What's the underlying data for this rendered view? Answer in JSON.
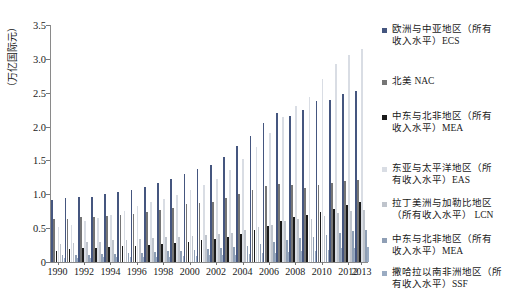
{
  "chart_data": {
    "type": "bar",
    "title": "",
    "xlabel": "",
    "ylabel": "（万亿国际元）",
    "ylim": [
      0,
      3.5
    ],
    "yticks": [
      "0",
      "0.5",
      "1.0",
      "1.5",
      "2.0",
      "2.5",
      "3.0",
      "3.5"
    ],
    "ytick_values": [
      0,
      0.5,
      1.0,
      1.5,
      2.0,
      2.5,
      3.0,
      3.5
    ],
    "grid": false,
    "legend_position": "right",
    "categories": [
      "1990",
      "1991",
      "1992",
      "1993",
      "1994",
      "1995",
      "1996",
      "1997",
      "1998",
      "1999",
      "2000",
      "2001",
      "2002",
      "2003",
      "2004",
      "2005",
      "2006",
      "2007",
      "2008",
      "2009",
      "2010",
      "2011",
      "2012",
      "2013"
    ],
    "xtick_labels": [
      "1990",
      "1992",
      "1994",
      "1996",
      "1998",
      "2000",
      "2002",
      "2004",
      "2006",
      "2008",
      "2010",
      "2012",
      "2013"
    ],
    "series": [
      {
        "name": "欧洲与中亚地区（所有收入水平）ECS",
        "short": "ECS",
        "color": "#45567f",
        "values": [
          0.92,
          0.95,
          0.96,
          0.96,
          1.0,
          1.03,
          1.06,
          1.11,
          1.17,
          1.22,
          1.3,
          1.37,
          1.44,
          1.55,
          1.71,
          1.86,
          2.05,
          2.2,
          2.15,
          2.24,
          2.38,
          2.4,
          2.48,
          2.52
        ]
      },
      {
        "name": "北美 NAC",
        "short": "NAC",
        "color": "#757575",
        "values": [
          0.63,
          0.64,
          0.66,
          0.67,
          0.68,
          0.69,
          0.71,
          0.74,
          0.77,
          0.8,
          0.85,
          0.87,
          0.89,
          0.94,
          1.0,
          1.07,
          1.12,
          1.15,
          1.13,
          1.1,
          1.14,
          1.16,
          1.19,
          1.21
        ]
      },
      {
        "name": "中东与北非地区（所有收入水平）MEA",
        "short": "MEA",
        "color": "#1a1a1a",
        "values": [
          0.17,
          0.19,
          0.2,
          0.21,
          0.22,
          0.23,
          0.24,
          0.25,
          0.26,
          0.28,
          0.3,
          0.32,
          0.34,
          0.37,
          0.42,
          0.47,
          0.53,
          0.6,
          0.66,
          0.69,
          0.74,
          0.79,
          0.84,
          0.88
        ]
      },
      {
        "name": "东亚与太平洋地区（所有收入水平）EAS",
        "short": "EAS",
        "color": "#d9dde4",
        "values": [
          0.52,
          0.55,
          0.6,
          0.65,
          0.7,
          0.76,
          0.82,
          0.88,
          0.93,
          0.99,
          1.07,
          1.14,
          1.23,
          1.36,
          1.52,
          1.7,
          1.91,
          2.14,
          2.3,
          2.44,
          2.7,
          2.92,
          3.05,
          3.14
        ]
      },
      {
        "name": "拉丁美洲与加勒比地区（所有收入水平）LCN",
        "short": "LCN",
        "color": "#bfc4cc",
        "values": [
          0.27,
          0.28,
          0.29,
          0.3,
          0.32,
          0.32,
          0.34,
          0.36,
          0.37,
          0.37,
          0.39,
          0.4,
          0.41,
          0.43,
          0.47,
          0.51,
          0.55,
          0.6,
          0.64,
          0.63,
          0.68,
          0.72,
          0.75,
          0.77
        ]
      },
      {
        "name": "中东与北非地区（所有收入水平）MEA",
        "short": "MEA",
        "color": "#8f9fb5",
        "values": [
          0.1,
          0.11,
          0.11,
          0.12,
          0.12,
          0.13,
          0.14,
          0.15,
          0.16,
          0.17,
          0.18,
          0.19,
          0.2,
          0.22,
          0.24,
          0.27,
          0.3,
          0.33,
          0.36,
          0.37,
          0.4,
          0.43,
          0.46,
          0.48
        ]
      },
      {
        "name": "撒哈拉以南非洲地区（所有收入水平）SSF",
        "short": "SSF",
        "color": "#9aabc2",
        "values": [
          0.06,
          0.06,
          0.06,
          0.07,
          0.07,
          0.07,
          0.08,
          0.08,
          0.08,
          0.09,
          0.09,
          0.1,
          0.1,
          0.11,
          0.12,
          0.13,
          0.14,
          0.15,
          0.17,
          0.17,
          0.18,
          0.2,
          0.21,
          0.22
        ]
      }
    ],
    "legend": [
      {
        "label": "欧洲与中亚地区（所有\n收入水平）ECS",
        "color": "#45567f"
      },
      {
        "label": "北美 NAC",
        "color": "#757575"
      },
      {
        "label": "中东与北非地区（所有\n收入水平）MEA",
        "color": "#1a1a1a"
      },
      {
        "label": "东亚与太平洋地区（所\n有收入水平）EAS",
        "color": "#d9dde4"
      },
      {
        "label": "拉丁美洲与加勒比地区\n  （所有收入水平） LCN",
        "color": "#bfc4cc"
      },
      {
        "label": "中东与北非地区（所有\n收入水平）MEA",
        "color": "#8f9fb5"
      },
      {
        "label": "撒哈拉以南非洲地区（所\n有收入水平）SSF",
        "color": "#9aabc2"
      }
    ]
  }
}
